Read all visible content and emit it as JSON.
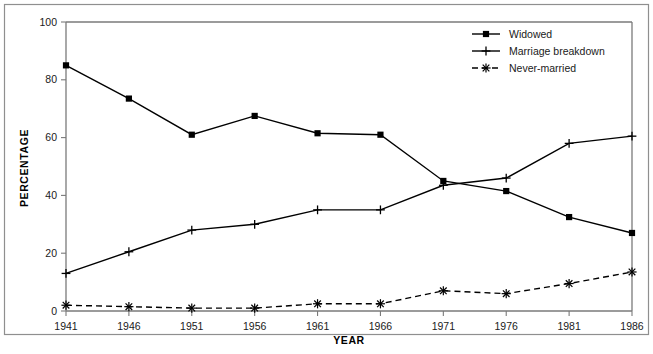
{
  "chart_data": {
    "type": "line",
    "title": "",
    "xlabel": "YEAR",
    "ylabel": "PERCENTAGE",
    "categories": [
      "1941",
      "1946",
      "1951",
      "1956",
      "1961",
      "1966",
      "1971",
      "1976",
      "1981",
      "1986"
    ],
    "x": [
      1941,
      1946,
      1951,
      1956,
      1961,
      1966,
      1971,
      1976,
      1981,
      1986
    ],
    "xlim": [
      1941,
      1986
    ],
    "ylim": [
      0,
      100
    ],
    "yticks": [
      0,
      20,
      40,
      60,
      80,
      100
    ],
    "ytick_labels": [
      "0",
      "20",
      "40",
      "60",
      "80",
      "100"
    ],
    "grid": false,
    "legend_position": "top-right",
    "series": [
      {
        "name": "Widowed",
        "marker": "square",
        "line_style": "solid",
        "color": "#000000",
        "values": [
          85,
          73.5,
          61,
          67.5,
          61.5,
          61,
          45,
          41.5,
          32.5,
          27
        ]
      },
      {
        "name": "Marriage breakdown",
        "marker": "plus",
        "line_style": "solid",
        "color": "#000000",
        "values": [
          13,
          20.5,
          28,
          30,
          35,
          35,
          43.5,
          46,
          58,
          60.5
        ]
      },
      {
        "name": "Never-married",
        "marker": "star",
        "line_style": "dashed",
        "color": "#000000",
        "values": [
          2,
          1.5,
          1,
          1,
          2.5,
          2.5,
          7,
          6,
          9.5,
          13.5
        ]
      }
    ]
  },
  "legend": {
    "entries": [
      {
        "label": "Widowed",
        "marker": "square",
        "line_style": "solid"
      },
      {
        "label": "Marriage breakdown",
        "marker": "plus",
        "line_style": "solid"
      },
      {
        "label": "Never-married",
        "marker": "star",
        "line_style": "dashed"
      }
    ]
  },
  "axes": {
    "x_title": "YEAR",
    "y_title": "PERCENTAGE"
  }
}
